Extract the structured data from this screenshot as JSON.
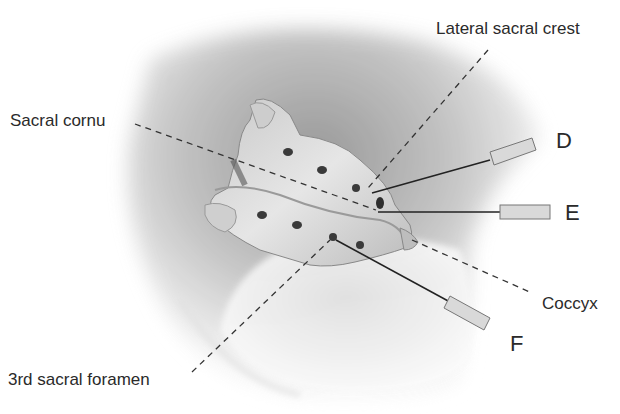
{
  "figure": {
    "labels": {
      "lateral_sacral_crest": "Lateral sacral crest",
      "sacral_cornu": "Sacral cornu",
      "coccyx": "Coccyx",
      "third_sacral_foramen": "3rd sacral foramen"
    },
    "needles": [
      {
        "id": "D",
        "label": "D"
      },
      {
        "id": "E",
        "label": "E"
      },
      {
        "id": "F",
        "label": "F"
      }
    ],
    "colors": {
      "text": "#2a2a2a",
      "skin_shadow": "#9a9a9a",
      "bone": "#d8d8d8",
      "foramen": "#3a3a3a",
      "leader_line": "#333333"
    }
  }
}
